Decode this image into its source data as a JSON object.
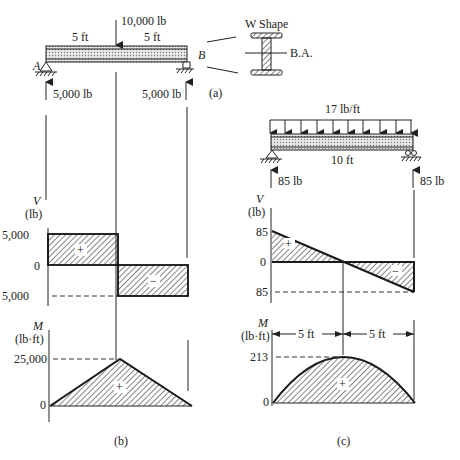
{
  "figure_a": {
    "caption": "(a)",
    "point_load": "10,000 lb",
    "span_left": "5 ft",
    "span_right": "5 ft",
    "support_left_label": "A",
    "support_right_label": "B",
    "reaction_left": "5,000 lb",
    "reaction_right": "5,000 lb",
    "section_title": "W Shape",
    "section_axis": "B.A."
  },
  "figure_b": {
    "caption": "(b)",
    "shear": {
      "axis_symbol": "V",
      "axis_unit": "(lb)",
      "tick_top": "5,000",
      "tick_zero": "0",
      "tick_bottom": "5,000",
      "sign_pos": "+",
      "sign_neg": "−"
    },
    "moment": {
      "axis_symbol": "M",
      "axis_unit": "(lb·ft)",
      "tick_top": "25,000",
      "tick_zero": "0",
      "sign_pos": "+"
    }
  },
  "figure_c": {
    "caption": "(c)",
    "distributed_load": "17 lb/ft",
    "span": "10 ft",
    "reaction_left": "85 lb",
    "reaction_right": "85 lb",
    "shear": {
      "axis_symbol": "V",
      "axis_unit": "(lb)",
      "tick_top": "85",
      "tick_zero": "0",
      "tick_bottom": "85",
      "sign_pos": "+",
      "sign_neg": "−"
    },
    "moment": {
      "axis_symbol": "M",
      "axis_unit": "(lb·ft)",
      "tick_top": "213",
      "tick_zero": "0",
      "dim_left": "5 ft",
      "dim_right": "5 ft",
      "sign_pos": "+"
    }
  }
}
